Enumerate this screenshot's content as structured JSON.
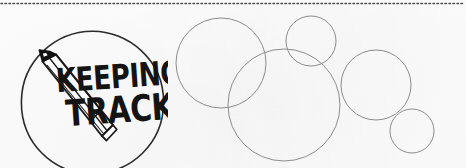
{
  "banner": {
    "width": 466,
    "height": 168,
    "background_color": "#fdfdfd",
    "alt_text": "Keeping Track hand-drawn logo badge beside a cluster of thin outlined circles"
  },
  "divider": {
    "name": "dotted-rule",
    "style": "dotted",
    "color": "#4a4a4a",
    "dot_count": 116,
    "dot_size_px": 1.5,
    "y_position_px": 3
  },
  "logo": {
    "badge_shape": "hand-drawn-circle",
    "outline_color": "#2b2b2b",
    "outline_width_px": 1.6,
    "center": {
      "x": 92,
      "y": 102
    },
    "radius_px": 71,
    "icon_name": "pencil-icon",
    "icon_color": "#1a1a1a",
    "title_line_1": "KEEPING",
    "title_line_2": "TRACK",
    "text_color": "#141414"
  },
  "circles": {
    "stroke_color": "#8c8c8c",
    "stroke_width_px": 1,
    "fill": "none",
    "count": 5,
    "items": [
      {
        "label": "circle-top-left",
        "cx": 221,
        "cy": 63,
        "r": 45
      },
      {
        "label": "circle-center-large",
        "cx": 284,
        "cy": 105,
        "r": 56
      },
      {
        "label": "circle-top-small",
        "cx": 311,
        "cy": 41,
        "r": 25
      },
      {
        "label": "circle-right-mid",
        "cx": 376,
        "cy": 85,
        "r": 35
      },
      {
        "label": "circle-bottom-right",
        "cx": 412,
        "cy": 131,
        "r": 22
      }
    ]
  }
}
